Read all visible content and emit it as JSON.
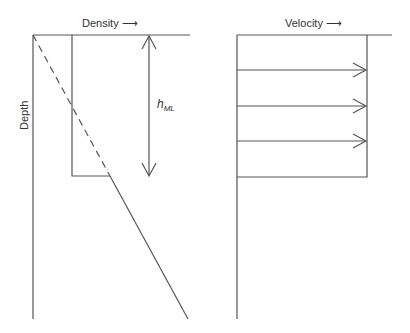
{
  "figure": {
    "left_panel": {
      "title": "Density",
      "title_arrow": "⟶",
      "y_axis_label": "Depth",
      "mixed_layer_label_main": "h",
      "mixed_layer_label_sub": "ML",
      "profiles": {
        "uniform_density_in_mixed_layer": "step profile",
        "linear_density_below": "solid diagonal",
        "extrapolated_linear_profile": "dashed diagonal"
      }
    },
    "right_panel": {
      "title": "Velocity",
      "title_arrow": "⟶",
      "arrow_count": 3
    },
    "colors": {
      "line": "#555555",
      "text": "#333333",
      "background": "#ffffff"
    }
  }
}
